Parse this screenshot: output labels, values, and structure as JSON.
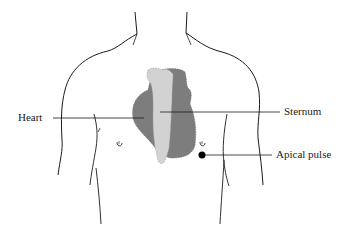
{
  "diagram": {
    "labels": {
      "heart": "Heart",
      "sternum": "Sternum",
      "apical_pulse": "Apical pulse"
    },
    "colors": {
      "heart": "#7d7d7d",
      "sternum": "#d2d2d2",
      "outline": "#1a1a1a",
      "apical_marker": "#000000",
      "background": "#ffffff"
    }
  }
}
